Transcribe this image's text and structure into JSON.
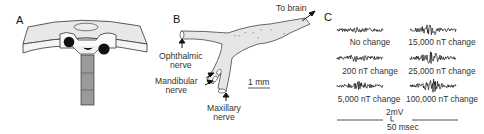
{
  "figure": {
    "panels": [
      {
        "id": "A",
        "label": "A",
        "description": "Schematic of skull section with electrode"
      },
      {
        "id": "B",
        "label": "B",
        "description": "Trigeminal nerve ganglion schematic"
      },
      {
        "id": "C",
        "label": "C",
        "description": "Nerve recordings under magnetic field changes"
      }
    ],
    "panel_b": {
      "to_brain": "To brain",
      "ophthalmic_1": "Ophthalmic",
      "ophthalmic_2": "nerve",
      "mandibular_1": "Mandibular",
      "mandibular_2": "nerve",
      "maxillary_1": "Maxillary",
      "maxillary_2": "nerve",
      "scale": "1 mm"
    },
    "panel_c": {
      "traces": [
        {
          "label": "No change",
          "column": 0,
          "row": 0,
          "activity": 0.2
        },
        {
          "label": "200 nT change",
          "column": 0,
          "row": 1,
          "activity": 0.45
        },
        {
          "label": "5,000 nT change",
          "column": 0,
          "row": 2,
          "activity": 0.55
        },
        {
          "label": "15,000 nT change",
          "column": 1,
          "row": 0,
          "activity": 0.7
        },
        {
          "label": "25,000 nT change",
          "column": 1,
          "row": 1,
          "activity": 0.8
        },
        {
          "label": "100,000 nT change",
          "column": 1,
          "row": 2,
          "activity": 1.0
        }
      ],
      "scale_voltage": "2mV",
      "scale_time": "50 msec"
    }
  }
}
